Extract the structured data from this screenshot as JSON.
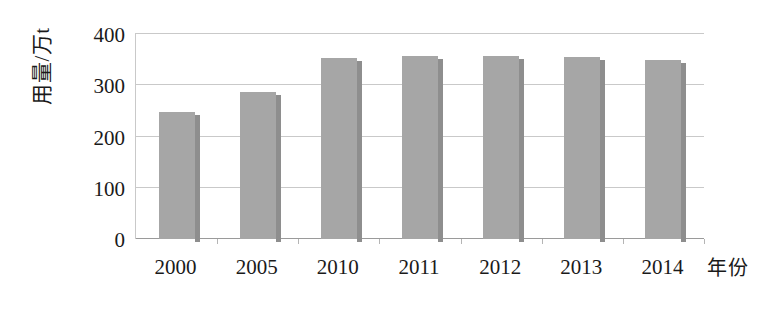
{
  "chart_data": {
    "type": "bar",
    "title": "",
    "xlabel": "年份",
    "ylabel": "用量/万t",
    "categories": [
      "2000",
      "2005",
      "2010",
      "2011",
      "2012",
      "2013",
      "2014"
    ],
    "values": [
      247,
      286,
      352,
      355,
      355,
      354,
      347
    ],
    "series": [
      {
        "name": "用量",
        "values": [
          247,
          286,
          352,
          355,
          355,
          354,
          347
        ]
      }
    ],
    "ylim": [
      0,
      400
    ],
    "yticks": [
      0,
      100,
      200,
      300,
      400
    ],
    "ytick_labels": [
      "0",
      "100",
      "200",
      "300",
      "400"
    ],
    "grid": true,
    "grid_axis": "y",
    "legend": false,
    "legend_position": "none",
    "bar_color": "#a6a6a6",
    "bar_shadow_color": "#8e8e8e",
    "gridline_color": "#c9c9c9",
    "axis_color": "#9a9a9a",
    "background_color": "#ffffff"
  },
  "axes": {
    "y_title": "用量/万t",
    "x_title": "年份"
  }
}
